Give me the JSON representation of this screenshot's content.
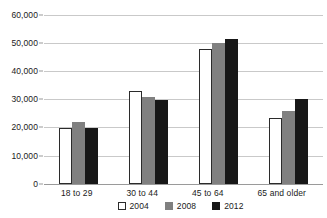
{
  "chart_data": {
    "type": "bar",
    "title": "",
    "subtitle": "",
    "xlabel": "",
    "ylabel": "",
    "categories": [
      "18 to 29",
      "30 to 44",
      "45 to 64",
      "65 and older"
    ],
    "series": [
      {
        "name": "2004",
        "color": "#ffffff",
        "values": [
          20000,
          33000,
          48000,
          23500
        ]
      },
      {
        "name": "2008",
        "color": "#808080",
        "values": [
          22000,
          31000,
          50000,
          26000
        ]
      },
      {
        "name": "2012",
        "color": "#171717",
        "values": [
          19800,
          30000,
          51500,
          30300
        ]
      }
    ],
    "ylim": [
      0,
      60000
    ],
    "ytick_labels": [
      "60,000",
      "50,000",
      "40,000",
      "30,000",
      "20,000",
      "10,000",
      "0"
    ],
    "ytick_values": [
      60000,
      50000,
      40000,
      30000,
      20000,
      10000,
      0
    ],
    "grid": true,
    "legend_position": "bottom"
  },
  "legend": {
    "items": [
      {
        "label": "2004"
      },
      {
        "label": "2008"
      },
      {
        "label": "2012"
      }
    ]
  }
}
